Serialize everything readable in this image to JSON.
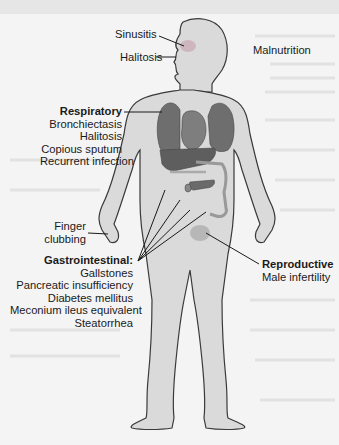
{
  "diagram": {
    "colors": {
      "background": "#f4f4f4",
      "body_fill": "#d9d9d9",
      "body_outline": "#3a3a3a",
      "organ_fill": "#6e6e6e",
      "organ_highlight": "#8a8a8a",
      "gi_tract": "#cfcfcf",
      "text": "#1a1a1a",
      "leader_line": "#1a1a1a",
      "highlight_spot": "#b8a0a8"
    },
    "labels": {
      "sinusitis": "Sinusitis",
      "halitosis_head": "Halitosis",
      "malnutrition": "Malnutrition",
      "finger_clubbing_1": "Finger",
      "finger_clubbing_2": "clubbing"
    },
    "groups": {
      "respiratory": {
        "heading": "Respiratory",
        "items": [
          "Bronchiectasis",
          "Halitosis",
          "Copious sputum",
          "Recurrent infection"
        ]
      },
      "gastrointestinal": {
        "heading": "Gastrointestinal:",
        "items": [
          "Gallstones",
          "Pancreatic insufficiency",
          "Diabetes mellitus",
          "Meconium ileus equivalent",
          "Steatorrhea"
        ]
      },
      "reproductive": {
        "heading": "Reproductive",
        "items": [
          "Male infertility"
        ]
      }
    }
  }
}
